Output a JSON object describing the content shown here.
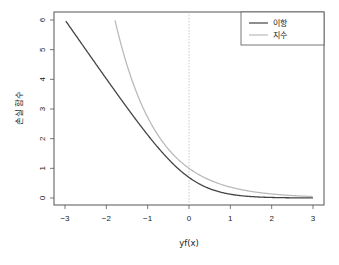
{
  "chart_data": {
    "type": "line",
    "title": "",
    "xlabel": "yf(x)",
    "ylabel": "손실 함수",
    "xlim": [
      -3,
      3
    ],
    "ylim": [
      0,
      6
    ],
    "x_ticks": [
      -3,
      -2,
      -1,
      0,
      1,
      2,
      3
    ],
    "y_ticks": [
      0,
      1,
      2,
      3,
      4,
      5,
      6
    ],
    "grid": false,
    "legend_position": "top-right",
    "reference_lines": [
      {
        "type": "vertical",
        "x": 0,
        "style": "dotted",
        "color": "#bbbbbb"
      }
    ],
    "series": [
      {
        "name": "이항",
        "color": "#444444",
        "formula": "log(1+exp(-2z))",
        "x": [
          -3,
          -2.5,
          -2,
          -1.5,
          -1,
          -0.5,
          0,
          0.5,
          1,
          1.5,
          2,
          2.5,
          3
        ],
        "values": [
          6.0,
          5.01,
          4.02,
          3.05,
          2.13,
          1.31,
          0.69,
          0.31,
          0.13,
          0.05,
          0.02,
          0.01,
          0.0
        ]
      },
      {
        "name": "지수",
        "color": "#bbbbbb",
        "formula": "exp(-z)",
        "x": [
          -1.79,
          -1.5,
          -1,
          -0.5,
          0,
          0.5,
          1,
          1.5,
          2,
          2.5,
          3
        ],
        "values": [
          6.0,
          4.48,
          2.72,
          1.65,
          1.0,
          0.61,
          0.37,
          0.22,
          0.14,
          0.08,
          0.05
        ]
      }
    ]
  },
  "labels": {
    "xlabel": "yf(x)",
    "ylabel": "손실 함수",
    "legend": [
      "이항",
      "지수"
    ],
    "x_ticks": [
      "−3",
      "−2",
      "−1",
      "0",
      "1",
      "2",
      "3"
    ],
    "y_ticks": [
      "0",
      "1",
      "2",
      "3",
      "4",
      "5",
      "6"
    ]
  }
}
